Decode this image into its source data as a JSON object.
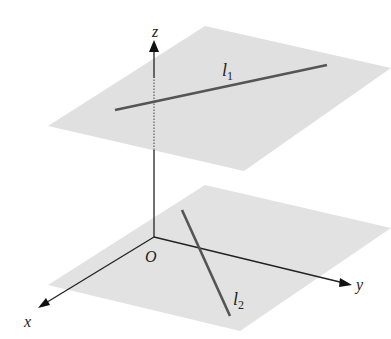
{
  "diagram": {
    "axes": {
      "z_label": "z",
      "x_label": "x",
      "y_label": "y",
      "origin_label": "O"
    },
    "lines": [
      {
        "name": "l",
        "subscript": "1",
        "plane": "upper"
      },
      {
        "name": "l",
        "subscript": "2",
        "plane": "lower"
      }
    ],
    "colors": {
      "plane_fill": "#e0e0e0",
      "line_color": "#555555",
      "axis_color": "#222222"
    }
  }
}
